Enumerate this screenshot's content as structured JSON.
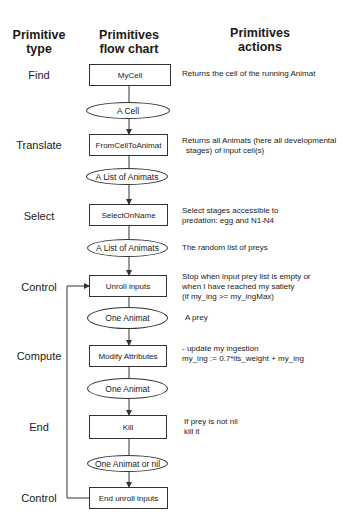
{
  "headers": {
    "type": [
      "Primitive",
      "type"
    ],
    "flow": [
      "Primitives",
      "flow chart"
    ],
    "actions": [
      "Primitives",
      "actions"
    ]
  },
  "rows": [
    {
      "type": "Find",
      "node": "MyCell",
      "action": [
        "Returns the cell of the running Animat"
      ]
    },
    {
      "output": "A Cell"
    },
    {
      "type": "Translate",
      "node": "FromCellToAnimat",
      "action": [
        "Returns all Animats (here all developmental",
        "  stages) of input cell(s)"
      ]
    },
    {
      "output": "A List of Animats"
    },
    {
      "type": "Select",
      "node": "SelectOnName",
      "action": [
        "Select stages accessible to",
        "predation: egg and  N1-N4"
      ]
    },
    {
      "output": "A List of Animats",
      "action": [
        "The random list of preys"
      ]
    },
    {
      "type": "Control",
      "node": "Unroll inputs",
      "action": [
        "Stop when input prey list is empty or",
        "when I have reached my satiety",
        "(if my_ing >= my_ingMax)"
      ]
    },
    {
      "output": "One Animat",
      "action": [
        "A  prey"
      ]
    },
    {
      "type": "Compute",
      "node": "Modify Attributes",
      "action": [
        "- update my ingestion",
        "my_ing := 0.7*its_weight + my_ing"
      ]
    },
    {
      "output": "One Animat"
    },
    {
      "type": "End",
      "node": "Kill",
      "action": [
        "If prey is not nil",
        "kill it"
      ]
    },
    {
      "output": "One Animat or nil"
    },
    {
      "type": "Control",
      "node": "End unroll inputs"
    }
  ]
}
